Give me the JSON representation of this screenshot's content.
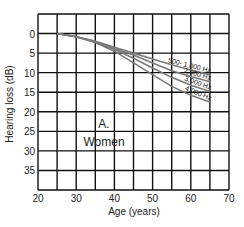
{
  "chart_data": {
    "type": "line",
    "title": "",
    "panel_label": "A.",
    "panel_sublabel": "Women",
    "xlabel": "Age (years)",
    "ylabel": "Hearing loss (dB)",
    "xlim": [
      20,
      70
    ],
    "ylim": [
      -5,
      40
    ],
    "y_inverted": true,
    "grid": true,
    "x_ticks": [
      20,
      30,
      40,
      50,
      60,
      70
    ],
    "y_ticks": [
      0,
      5,
      10,
      15,
      20,
      25,
      30,
      35
    ],
    "x_grid_step": 5,
    "y_grid_step": 5,
    "series": [
      {
        "name": "500- 1,000 Hz",
        "x": [
          25,
          30,
          35,
          40,
          45,
          50,
          55,
          60,
          65
        ],
        "values": [
          0,
          0.8,
          2,
          3.5,
          5,
          6.5,
          8,
          9.3,
          10.5
        ]
      },
      {
        "name": "2,000 Hz",
        "x": [
          25,
          30,
          35,
          40,
          45,
          50,
          55,
          60,
          65
        ],
        "values": [
          0,
          0.8,
          2,
          3.8,
          5.5,
          7.5,
          9.5,
          11,
          12.3
        ]
      },
      {
        "name": "3,000 Hz",
        "x": [
          25,
          30,
          35,
          40,
          45,
          50,
          55,
          60,
          65
        ],
        "values": [
          0,
          0.8,
          2.2,
          4,
          6.3,
          8.8,
          11.2,
          13.2,
          14.8
        ]
      },
      {
        "name": "4,000 Hz",
        "x": [
          25,
          30,
          35,
          40,
          45,
          50,
          55,
          60,
          65
        ],
        "values": [
          0,
          0.8,
          2.3,
          4.5,
          7.5,
          10.5,
          13.5,
          15.8,
          17.5
        ]
      }
    ],
    "series_color": "#7a7a7a",
    "grid_color": "#111111"
  }
}
